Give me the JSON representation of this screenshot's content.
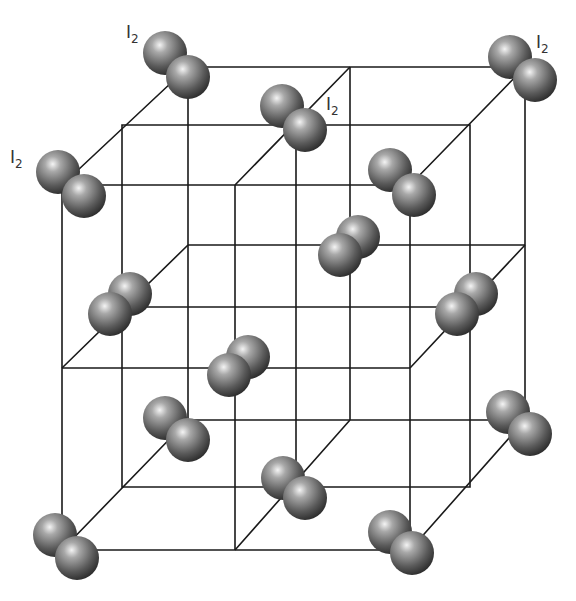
{
  "diagram": {
    "labels": [
      {
        "id": "label-top-left",
        "text": "I",
        "sub": "2",
        "x": 126,
        "y": 38
      },
      {
        "id": "label-left",
        "text": "I",
        "sub": "2",
        "x": 10,
        "y": 163
      },
      {
        "id": "label-center-top",
        "text": "I",
        "sub": "2",
        "x": 326,
        "y": 110
      },
      {
        "id": "label-top-right",
        "text": "I",
        "sub": "2",
        "x": 536,
        "y": 48
      }
    ],
    "colors": {
      "line": "#1a1a1a",
      "sphere_light": "#f4f4f4",
      "sphere_mid": "#8a8a8a",
      "sphere_dark": "#3a3a3a",
      "background": "#ffffff"
    }
  }
}
